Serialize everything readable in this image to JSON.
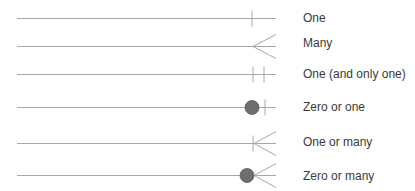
{
  "colors": {
    "line": "#a8a8a8",
    "circle_fill": "#6e6e6e",
    "circle_stroke": "#5a5a5a",
    "text": "#3a3a3a"
  },
  "rows": [
    {
      "symbol": "one",
      "label": "One"
    },
    {
      "symbol": "many",
      "label": "Many"
    },
    {
      "symbol": "one-and-only-one",
      "label": "One (and only one)"
    },
    {
      "symbol": "zero-or-one",
      "label": "Zero or one"
    },
    {
      "symbol": "one-or-many",
      "label": "One or many"
    },
    {
      "symbol": "zero-or-many",
      "label": "Zero or many"
    }
  ]
}
